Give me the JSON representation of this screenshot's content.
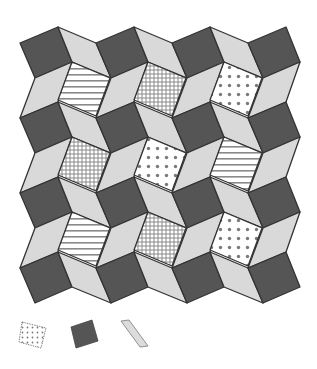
{
  "figure": {
    "colors": {
      "dark_square": "#555555",
      "light_rhombus": "#d9d9d9",
      "pattern_background": "#ffffff",
      "pattern_ink": "#7a7a7a",
      "stroke": "#333333"
    },
    "grid": {
      "columns": 4,
      "rows": 4,
      "origin": [
        20,
        43
      ],
      "period_x": 76,
      "period_y": 75,
      "square_vectors": [
        [
          38,
          -16
        ],
        [
          15,
          35
        ]
      ],
      "pattern_square_vectors": [
        [
          38,
          16
        ],
        [
          -14,
          38
        ]
      ]
    },
    "pattern_tiles": [
      [
        "horizontal-lines",
        "grid",
        "dots"
      ],
      [
        "grid",
        "dots",
        "horizontal-lines"
      ],
      [
        "horizontal-lines",
        "grid",
        "dots"
      ]
    ],
    "legend": [
      {
        "name": "dotted-square",
        "shape": "square",
        "fill": "dots"
      },
      {
        "name": "dark-square",
        "shape": "square",
        "fill": "dark"
      },
      {
        "name": "light-rhombus",
        "shape": "rhombus",
        "fill": "light"
      }
    ]
  }
}
